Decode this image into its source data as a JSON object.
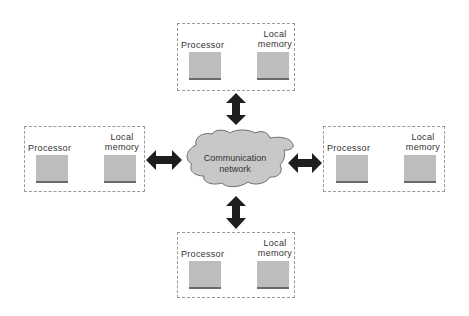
{
  "diagram": {
    "network": {
      "line1": "Communication",
      "line2": "network"
    },
    "nodes": [
      {
        "position": "top",
        "processor_label": "Processor",
        "memory_line1": "Local",
        "memory_line2": "memory"
      },
      {
        "position": "left",
        "processor_label": "Processor",
        "memory_line1": "Local",
        "memory_line2": "memory"
      },
      {
        "position": "right",
        "processor_label": "Processor",
        "memory_line1": "Local",
        "memory_line2": "memory"
      },
      {
        "position": "bottom",
        "processor_label": "Processor",
        "memory_line1": "Local",
        "memory_line2": "memory"
      }
    ],
    "colors": {
      "block": "#bdbdbd",
      "cloud": "#c8c8c8",
      "arrow": "#1e1e1e"
    }
  }
}
